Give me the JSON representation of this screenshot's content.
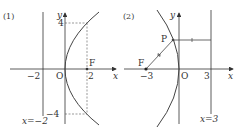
{
  "panels": [
    {
      "id": "panel-1",
      "label": "(1)",
      "axis_x_label": "x",
      "axis_y_label": "y",
      "origin_label": "O",
      "focus_label": "F",
      "tick_neg2": "−2",
      "tick_2": "2",
      "tick_4": "4",
      "tick_neg4": "−4",
      "directrix_label": "x=−2",
      "curve": "parabola y^2 = 8x (opens right)",
      "colors": {
        "curve": "#444444",
        "axes": "#333333",
        "dashed": "#555555"
      }
    },
    {
      "id": "panel-2",
      "label": "(2)",
      "axis_x_label": "x",
      "axis_y_label": "y",
      "origin_label": "O",
      "focus_label": "F",
      "point_label": "P",
      "tick_neg3": "−3",
      "tick_3": "3",
      "directrix_label": "x=3",
      "curve": "parabola y^2 = −12x (opens left)",
      "colors": {
        "curve": "#444444",
        "axes": "#333333"
      }
    }
  ]
}
